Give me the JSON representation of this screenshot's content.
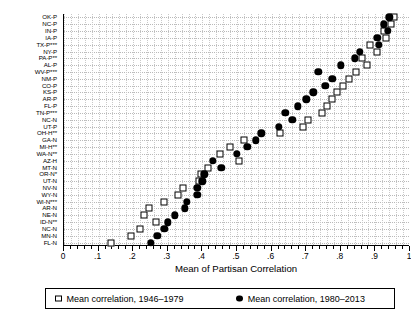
{
  "chart_data": {
    "type": "scatter",
    "title": "",
    "xlabel": "Mean of Partisan Correlation",
    "ylabel": "",
    "xlim": [
      0,
      1
    ],
    "ylim_categories_count": 34,
    "grid": true,
    "legend_position": "bottom",
    "xticks": [
      0,
      0.1,
      0.2,
      0.3,
      0.4,
      0.5,
      0.6,
      0.7,
      0.8,
      0.9,
      1
    ],
    "xtick_labels": [
      "0",
      ".1",
      ".2",
      ".3",
      ".4",
      ".5",
      ".6",
      ".7",
      ".8",
      ".9",
      "1"
    ],
    "xtick_minor_step": 0.02,
    "categories": [
      "OK-P",
      "NC-P",
      "IN-P",
      "IA-P",
      "TX-P***",
      "NY-P",
      "PA-P**",
      "AL-P",
      "WV-P***",
      "NM-P",
      "CO-P",
      "KS-P",
      "AR-P",
      "FL-P",
      "TN-P***",
      "NC-N",
      "UT-P",
      "OH-H**",
      "GA-N",
      "MI-H**",
      "WA-N**",
      "AZ-H",
      "MT-N",
      "OR-N*",
      "UT-N",
      "NV-N",
      "WY-N",
      "WI-N***",
      "AR-N",
      "NE-N",
      "ID-N**",
      "NC-N",
      "MN-N",
      "FL-N"
    ],
    "series": [
      {
        "name": "Mean correlation, 1946–1979",
        "marker": "hollow-square",
        "color": "#000000",
        "values": [
          0.955,
          0.945,
          0.925,
          0.93,
          0.885,
          0.905,
          0.86,
          0.875,
          0.845,
          0.825,
          0.805,
          0.79,
          0.775,
          0.76,
          0.745,
          0.705,
          0.69,
          0.625,
          0.52,
          0.48,
          0.45,
          0.505,
          0.415,
          0.395,
          0.39,
          0.345,
          0.33,
          0.29,
          0.245,
          0.23,
          0.265,
          0.22,
          0.195,
          0.135
        ]
      },
      {
        "name": "Mean correlation, 1980–2013",
        "marker": "filled-circle",
        "color": "#000000",
        "values": [
          0.94,
          0.925,
          0.935,
          0.905,
          0.91,
          0.855,
          0.84,
          0.8,
          0.735,
          0.775,
          0.755,
          0.72,
          0.7,
          0.675,
          0.64,
          0.66,
          0.62,
          0.57,
          0.555,
          0.53,
          0.5,
          0.43,
          0.455,
          0.405,
          0.4,
          0.385,
          0.385,
          0.355,
          0.35,
          0.32,
          0.3,
          0.29,
          0.27,
          0.25
        ]
      }
    ]
  },
  "legend": {
    "entries": [
      {
        "label": "Mean correlation, 1946–1979",
        "marker": "hollow-square"
      },
      {
        "label": "Mean correlation, 1980–2013",
        "marker": "filled-circle"
      }
    ]
  }
}
